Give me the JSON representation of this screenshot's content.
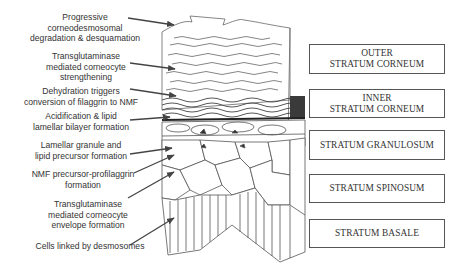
{
  "diagram": {
    "type": "epidermis-cross-section",
    "process_labels": [
      {
        "id": "desquamation",
        "lines": [
          "Progressive",
          "corneodesmosomal",
          "degradation & desquamation"
        ]
      },
      {
        "id": "tg-strengthening",
        "lines": [
          "Transglutaminase",
          "mediated corneocyte",
          "strengthening"
        ]
      },
      {
        "id": "dehydration",
        "lines": [
          "Dehydration triggers",
          "conversion of filaggrin to NMF"
        ]
      },
      {
        "id": "acidification",
        "lines": [
          "Acidification & lipid",
          "lamellar bilayer formation"
        ]
      },
      {
        "id": "lamellar-granule",
        "lines": [
          "Lamellar granule and",
          "lipid precursor formation"
        ]
      },
      {
        "id": "nmf-precursor",
        "lines": [
          "NMF precursor-profilaggrin",
          "formation"
        ]
      },
      {
        "id": "tg-envelope",
        "lines": [
          "Transglutaminase",
          "mediated corneocyte",
          "envelope formation"
        ]
      },
      {
        "id": "desmosomes",
        "lines": [
          "Cells linked by desmosomes"
        ]
      }
    ],
    "layers": [
      {
        "id": "outer-sc",
        "lines": [
          "OUTER",
          "STRATUM CORNEUM"
        ]
      },
      {
        "id": "inner-sc",
        "lines": [
          "INNER",
          "STRATUM CORNEUM"
        ]
      },
      {
        "id": "granulosum",
        "lines": [
          "STRATUM GRANULOSUM"
        ]
      },
      {
        "id": "spinosum",
        "lines": [
          "STRATUM SPINOSUM"
        ]
      },
      {
        "id": "basale",
        "lines": [
          "STRATUM BASALE"
        ]
      }
    ],
    "colors": {
      "ink": "#333333",
      "line": "#555555",
      "dark_band": "#3a3a3a",
      "background": "#ffffff"
    }
  }
}
